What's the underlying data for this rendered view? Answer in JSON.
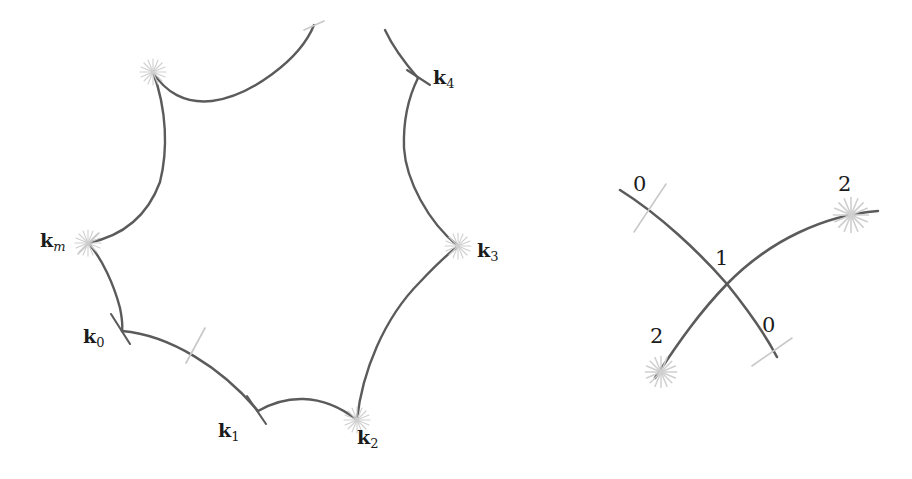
{
  "figure": {
    "background_color": "#ffffff",
    "curve_color": "#5b5b5b",
    "marker_light_color": "#c9c9c9",
    "text_color": "#1b1b1b"
  },
  "left_panel": {
    "name": "hyperbolic-polygon",
    "labels": [
      {
        "id": "k_m",
        "base": "k",
        "sub": "m",
        "sub_style": "italic",
        "x": 40,
        "y": 231
      },
      {
        "id": "k_0",
        "base": "k",
        "sub": "0",
        "sub_style": "roman",
        "x": 83,
        "y": 327
      },
      {
        "id": "k_1",
        "base": "k",
        "sub": "1",
        "sub_style": "roman",
        "x": 218,
        "y": 421
      },
      {
        "id": "k_2",
        "base": "k",
        "sub": "2",
        "sub_style": "roman",
        "x": 357,
        "y": 428
      },
      {
        "id": "k_3",
        "base": "k",
        "sub": "3",
        "sub_style": "roman",
        "x": 477,
        "y": 241
      },
      {
        "id": "k_4",
        "base": "k",
        "sub": "4",
        "sub_style": "roman",
        "x": 433,
        "y": 68
      }
    ],
    "vertices": [
      {
        "id": "top",
        "marker": "starburst",
        "x": 153,
        "y": 72,
        "shade": "light"
      },
      {
        "id": "k_m",
        "marker": "starburst",
        "x": 88,
        "y": 243,
        "shade": "light"
      },
      {
        "id": "k_0",
        "marker": "tick",
        "x": 122,
        "y": 328,
        "shade": "dark"
      },
      {
        "id": "k_1",
        "marker": "tick",
        "x": 258,
        "y": 410,
        "shade": "dark"
      },
      {
        "id": "k_2",
        "marker": "starburst",
        "x": 357,
        "y": 420,
        "shade": "light"
      },
      {
        "id": "k_3",
        "marker": "starburst",
        "x": 458,
        "y": 246,
        "shade": "light"
      },
      {
        "id": "k_4",
        "marker": "tick",
        "x": 418,
        "y": 78,
        "shade": "dark"
      },
      {
        "id": "mid_bottom",
        "marker": "tick",
        "x": 196,
        "y": 345,
        "shade": "light"
      },
      {
        "id": "top_right_end",
        "marker": "tick",
        "x": 314,
        "y": 25,
        "shade": "light"
      }
    ]
  },
  "right_panel": {
    "name": "crossing-geodesics",
    "labels": [
      {
        "id": "upper-left-zero",
        "text": "0",
        "x": 633,
        "y": 174
      },
      {
        "id": "upper-right-two",
        "text": "2",
        "x": 838,
        "y": 174
      },
      {
        "id": "center-one",
        "text": "1",
        "x": 715,
        "y": 248
      },
      {
        "id": "lower-right-zero",
        "text": "0",
        "x": 762,
        "y": 315
      },
      {
        "id": "lower-left-two",
        "text": "2",
        "x": 650,
        "y": 326
      }
    ],
    "markers": [
      {
        "id": "upper-left-tick",
        "marker": "tick",
        "x": 650,
        "y": 207,
        "shade": "light"
      },
      {
        "id": "upper-right-star",
        "marker": "starburst",
        "x": 851,
        "y": 215,
        "shade": "light"
      },
      {
        "id": "crossing-point",
        "marker": "crossing",
        "x": 727,
        "y": 284,
        "shade": "dark"
      },
      {
        "id": "lower-right-tick",
        "marker": "tick",
        "x": 772,
        "y": 351,
        "shade": "light"
      },
      {
        "id": "lower-left-star",
        "marker": "starburst",
        "x": 661,
        "y": 372,
        "shade": "light"
      }
    ]
  },
  "chart_data": {
    "type": "line",
    "xlabel": "",
    "ylabel": "",
    "xlim": [
      0,
      912
    ],
    "ylim": [
      479,
      0
    ],
    "grid": false,
    "legend": null,
    "annotations": [
      "k_m",
      "k_0",
      "k_1",
      "k_2",
      "k_3",
      "k_4",
      "0",
      "1",
      "2",
      "0",
      "2"
    ],
    "series": [
      {
        "name": "polygon-edge-top",
        "comment": "from top-right open end down-left to top vertex",
        "path": "M 314 25 C 300 60 250 96 212 101 C 185 104 165 92 153 72"
      },
      {
        "name": "polygon-edge-upper-left",
        "comment": "top vertex to k_m",
        "path": "M 153 72 C 167 110 168 150 160 182 C 146 220 118 237 88 243"
      },
      {
        "name": "polygon-edge-lower-left",
        "comment": "k_m to k_0",
        "path": "M 88 243 C 102 258 114 285 120 308 C 122 318 123 324 122 331"
      },
      {
        "name": "polygon-edge-bottom-left",
        "comment": "k_0 to k_1",
        "path": "M 122 331 C 170 335 222 368 258 411"
      },
      {
        "name": "polygon-edge-bottom",
        "comment": "k_1 to k_2",
        "path": "M 258 411 C 284 396 320 391 357 420"
      },
      {
        "name": "polygon-edge-lower-right",
        "comment": "k_2 to k_3",
        "path": "M 357 420 C 362 372 384 318 420 282 C 434 267 448 254 458 246"
      },
      {
        "name": "polygon-edge-upper-right",
        "comment": "k_3 to k_4",
        "path": "M 458 246 C 428 222 406 180 404 148 C 403 118 410 94 418 78"
      },
      {
        "name": "polygon-edge-top-right",
        "comment": "k_4 up to open end",
        "path": "M 418 78 C 404 62 392 45 385 30"
      },
      {
        "name": "geodesic-a",
        "comment": "upper-left 0 to lower-right 0, descending curve",
        "path": "M 620 190 C 660 215 700 253 727 284 C 748 310 765 334 777 357"
      },
      {
        "name": "geodesic-b",
        "comment": "lower-left 2 to upper-right 2, ascending curve",
        "path": "M 655 378 C 680 340 700 312 727 284 C 770 240 825 215 878 211"
      }
    ]
  }
}
